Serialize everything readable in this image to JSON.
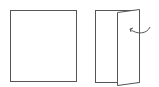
{
  "diagram": {
    "stroke_color": "#555555",
    "fill_color": "#ffffff",
    "items": [
      {
        "name": "flat-card"
      },
      {
        "name": "folded-card",
        "arrow": "fold-arrow"
      }
    ]
  }
}
